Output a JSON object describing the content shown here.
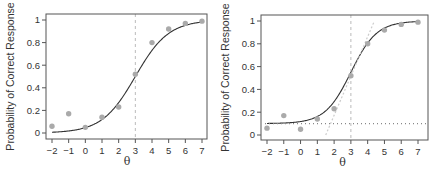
{
  "chart_data": [
    {
      "type": "line",
      "title": "",
      "xlabel": "θ",
      "ylabel": "Probability of Correct Response",
      "xlim": [
        -2,
        7
      ],
      "ylim": [
        0,
        1
      ],
      "x_ticks": [
        "−2",
        "−1",
        "0",
        "1",
        "2",
        "3",
        "4",
        "5",
        "6",
        "7"
      ],
      "y_ticks": [
        "0",
        "0.2",
        "0.4",
        "0.6",
        "0.8",
        "1"
      ],
      "grid": false,
      "series": [
        {
          "name": "observed proportions",
          "kind": "scatter",
          "color": "#aaaaaa",
          "x": [
            -2,
            -1,
            0,
            1,
            2,
            3,
            4,
            5,
            6,
            7
          ],
          "values": [
            0.06,
            0.17,
            0.05,
            0.14,
            0.23,
            0.52,
            0.8,
            0.92,
            0.97,
            0.99
          ]
        },
        {
          "name": "2PL item characteristic curve",
          "kind": "line",
          "color": "#333333",
          "params": {
            "a": 1.0,
            "b": 3,
            "c": 0
          }
        },
        {
          "name": "difficulty b",
          "kind": "vline",
          "x": 3,
          "style": "dashed",
          "color": "#bbbbbb"
        }
      ]
    },
    {
      "type": "line",
      "title": "",
      "xlabel": "θ",
      "ylabel": "Probability of Correct Response",
      "xlim": [
        -2,
        7
      ],
      "ylim": [
        0,
        1
      ],
      "x_ticks": [
        "−2",
        "−1",
        "0",
        "1",
        "2",
        "3",
        "4",
        "5",
        "6",
        "7"
      ],
      "y_ticks": [
        "0",
        "0.2",
        "0.4",
        "0.6",
        "0.8",
        "1"
      ],
      "grid": false,
      "series": [
        {
          "name": "observed proportions",
          "kind": "scatter",
          "color": "#aaaaaa",
          "x": [
            -2,
            -1,
            0,
            1,
            2,
            3,
            4,
            5,
            6,
            7
          ],
          "values": [
            0.06,
            0.17,
            0.05,
            0.14,
            0.23,
            0.52,
            0.8,
            0.92,
            0.97,
            0.99
          ]
        },
        {
          "name": "3PL item characteristic curve",
          "kind": "line",
          "color": "#333333",
          "params": {
            "a": 1.3,
            "b": 3,
            "c": 0.1
          }
        },
        {
          "name": "guessing asymptote c",
          "kind": "hline",
          "y": 0.1,
          "style": "dotted",
          "color": "#888888"
        },
        {
          "name": "difficulty b",
          "kind": "vline",
          "x": 3,
          "style": "dashed",
          "color": "#bbbbbb"
        },
        {
          "name": "slope tangent at b",
          "kind": "line",
          "style": "dotted",
          "color": "#cccccc",
          "x": [
            1.5,
            4.4
          ],
          "values": [
            0,
            1
          ]
        }
      ]
    }
  ]
}
